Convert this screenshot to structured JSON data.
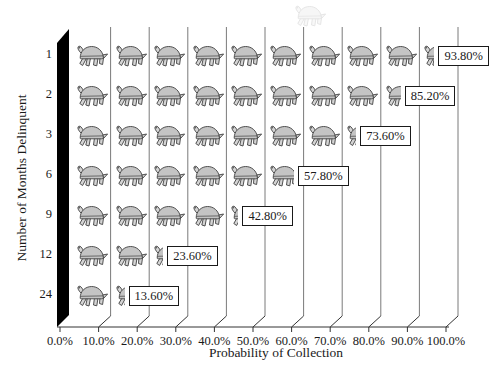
{
  "figure": {
    "x_axis": {
      "title": "Probability of Collection",
      "ticks": [
        "0.0%",
        "10.0%",
        "20.0%",
        "30.0%",
        "40.0%",
        "50.0%",
        "60.0%",
        "70.0%",
        "80.0%",
        "90.0%",
        "100.0%"
      ]
    },
    "y_axis": {
      "title": "Number of Months Delinquent",
      "ticks": [
        "1",
        "2",
        "3",
        "6",
        "9",
        "12",
        "24"
      ]
    }
  },
  "chart_data": {
    "type": "bar",
    "subtype": "pictograph",
    "icon": "turtle",
    "icon_unit_percent": 10,
    "title": "",
    "xlabel": "Probability of Collection",
    "ylabel": "Number of Months Delinquent",
    "categories": [
      "1",
      "2",
      "3",
      "6",
      "9",
      "12",
      "24"
    ],
    "values": [
      93.8,
      85.2,
      73.6,
      57.8,
      42.8,
      23.6,
      13.6
    ],
    "value_labels": [
      "93.80%",
      "85.20%",
      "73.60%",
      "57.80%",
      "42.80%",
      "23.60%",
      "13.60%"
    ],
    "x_tick_labels": [
      "0.0%",
      "10.0%",
      "20.0%",
      "30.0%",
      "40.0%",
      "50.0%",
      "60.0%",
      "70.0%",
      "80.0%",
      "90.0%",
      "100.0%"
    ],
    "xlim": [
      0,
      100
    ],
    "x_tick_step": 10,
    "grid": true,
    "legend": "none",
    "colors": {
      "background": "#ffffff",
      "icon_shell": "#c4c4c4",
      "icon_limbs": "#d4d4d4",
      "icon_stroke": "#3f3f3f",
      "gridline": "#7a7a7a",
      "axis": "#333333",
      "wall": "#000000",
      "label_box_bg": "#ffffff",
      "label_box_border": "#1a1a1a",
      "text": "#1a1a1a"
    }
  }
}
